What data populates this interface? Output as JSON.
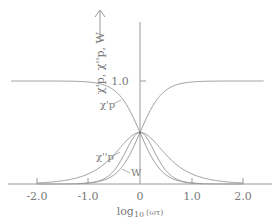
{
  "chart_data": {
    "type": "line",
    "title": "",
    "xlabel": "log10 (ωτ)",
    "ylabel": "χ'p, χ''p, W",
    "xlim": [
      -2.5,
      2.5
    ],
    "ylim": [
      0,
      1.6
    ],
    "grid": false,
    "legend": "inline labels",
    "x_ticks": [
      -2.0,
      -1.0,
      0,
      1.0,
      2.0
    ],
    "x_tick_labels": [
      "-2.0",
      "-1.0",
      "0",
      "1.0",
      "2.0"
    ],
    "y_ticks": [
      1.0
    ],
    "y_tick_labels": [
      "1.0"
    ],
    "x": [
      -2.5,
      -2.0,
      -1.5,
      -1.0,
      -0.5,
      0,
      0.5,
      1.0,
      1.5,
      2.0,
      2.5
    ],
    "series": [
      {
        "name": "χ'p (decreasing)",
        "values": [
          1.0,
          1.0,
          0.999,
          0.99,
          0.909,
          0.5,
          0.091,
          0.01,
          0.001,
          0.0,
          0.0
        ]
      },
      {
        "name": "χ'p mirror (increasing)",
        "values": [
          0.0,
          0.0,
          0.001,
          0.01,
          0.091,
          0.5,
          0.909,
          0.99,
          0.999,
          1.0,
          1.0
        ]
      },
      {
        "name": "χ''p",
        "values": [
          0.003,
          0.01,
          0.032,
          0.099,
          0.287,
          0.5,
          0.287,
          0.099,
          0.032,
          0.01,
          0.003
        ]
      },
      {
        "name": "W",
        "values": [
          0.0,
          0.0,
          0.002,
          0.02,
          0.165,
          0.5,
          0.165,
          0.02,
          0.002,
          0.0,
          0.0
        ]
      }
    ],
    "annotations": [
      "χ'p",
      "χ''p",
      "W"
    ]
  },
  "labels": {
    "y_axis_title": "χ'p, χ''p, W",
    "x_axis_title_main": "log",
    "x_axis_title_sub": "10",
    "x_axis_title_arg": "(ωτ)",
    "y_tick_1": "1.0",
    "x_ticks": [
      "-2.0",
      "-1.0",
      "0",
      "1.0",
      "2.0"
    ],
    "curve_chi_prime": "χ'p",
    "curve_chi_double_prime": "χ''p",
    "curve_w": "W"
  },
  "colors": {
    "line": "#9a9a9a",
    "text": "#7a7a7a"
  }
}
